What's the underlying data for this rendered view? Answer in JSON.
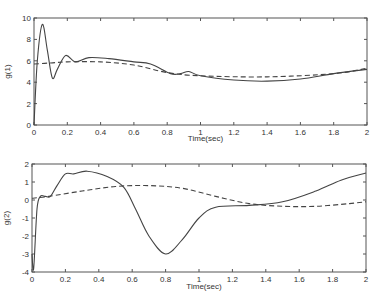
{
  "chart_data": [
    {
      "type": "line",
      "title": "",
      "xlabel": "Time(sec)",
      "ylabel": "g(1)",
      "xlim": [
        0,
        2
      ],
      "ylim": [
        0,
        10
      ],
      "xticks": [
        0,
        0.2,
        0.4,
        0.6,
        0.8,
        1,
        1.2,
        1.4,
        1.6,
        1.8,
        2
      ],
      "xtick_labels": [
        "0",
        "0.2",
        "0.4",
        "0.6",
        "0.8",
        "1",
        "1.2",
        "1.4",
        "1.6",
        "1.8",
        "2"
      ],
      "yticks": [
        0,
        2,
        4,
        6,
        8,
        10
      ],
      "ytick_labels": [
        "0",
        "2",
        "4",
        "6",
        "8",
        "10"
      ],
      "grid": false,
      "legend": null,
      "series": [
        {
          "name": "solid",
          "style": "solid",
          "x": [
            0,
            0.02,
            0.05,
            0.08,
            0.11,
            0.14,
            0.19,
            0.25,
            0.33,
            0.45,
            0.6,
            0.7,
            0.82,
            0.88,
            0.93,
            1.0,
            1.2,
            1.4,
            1.6,
            1.8,
            2.0
          ],
          "y": [
            0,
            6,
            9.4,
            7,
            4.4,
            5.2,
            6.5,
            5.9,
            6.3,
            6.2,
            5.9,
            5.7,
            4.8,
            4.8,
            5.0,
            4.6,
            4.2,
            4.1,
            4.3,
            4.8,
            5.2
          ]
        },
        {
          "name": "dashed",
          "style": "dashed",
          "x": [
            0,
            0.1,
            0.2,
            0.4,
            0.6,
            0.8,
            1.0,
            1.4,
            1.8,
            2.0
          ],
          "y": [
            5.7,
            5.8,
            5.9,
            5.9,
            5.6,
            4.9,
            4.6,
            4.5,
            4.8,
            5.3
          ]
        }
      ]
    },
    {
      "type": "line",
      "title": "",
      "xlabel": "Time(sec)",
      "ylabel": "g(2)",
      "xlim": [
        0,
        2
      ],
      "ylim": [
        -4,
        2
      ],
      "xticks": [
        0,
        0.2,
        0.4,
        0.6,
        0.8,
        1,
        1.2,
        1.4,
        1.6,
        1.8,
        2
      ],
      "xtick_labels": [
        "0",
        "0.2",
        "0.4",
        "0.6",
        "0.8",
        "1",
        "1.2",
        "1.4",
        "1.6",
        "1.8",
        "2"
      ],
      "yticks": [
        -4,
        -3,
        -2,
        -1,
        0,
        1,
        2
      ],
      "ytick_labels": [
        "-4",
        "-3",
        "-2",
        "-1",
        "0",
        "1",
        "2"
      ],
      "grid": false,
      "legend": null,
      "series": [
        {
          "name": "solid",
          "style": "solid",
          "x": [
            0,
            0.01,
            0.03,
            0.05,
            0.08,
            0.11,
            0.15,
            0.2,
            0.25,
            0.33,
            0.45,
            0.55,
            0.62,
            0.7,
            0.8,
            0.9,
            1.0,
            1.1,
            1.3,
            1.5,
            1.7,
            1.85,
            2.0
          ],
          "y": [
            -3,
            -3.8,
            -0.5,
            0.2,
            0.2,
            0.2,
            0.8,
            1.45,
            1.45,
            1.6,
            1.3,
            0.7,
            -0.5,
            -2.0,
            -3.0,
            -2.2,
            -1.0,
            -0.4,
            -0.3,
            -0.1,
            0.5,
            1.1,
            1.5
          ]
        },
        {
          "name": "dashed",
          "style": "dashed",
          "x": [
            0,
            0.1,
            0.3,
            0.5,
            0.7,
            0.9,
            1.1,
            1.3,
            1.5,
            1.7,
            1.9,
            2.0
          ],
          "y": [
            0.1,
            0.2,
            0.5,
            0.75,
            0.8,
            0.65,
            0.2,
            -0.2,
            -0.35,
            -0.35,
            -0.2,
            -0.1
          ]
        }
      ]
    }
  ],
  "layout": {
    "plots": [
      {
        "left": 34,
        "right": 367,
        "top": 18,
        "bottom": 125,
        "xlabel_y": 141,
        "ylabel_x": 10
      },
      {
        "left": 32,
        "right": 366,
        "top": 164,
        "bottom": 272,
        "xlabel_y": 289,
        "ylabel_x": 9
      }
    ]
  }
}
